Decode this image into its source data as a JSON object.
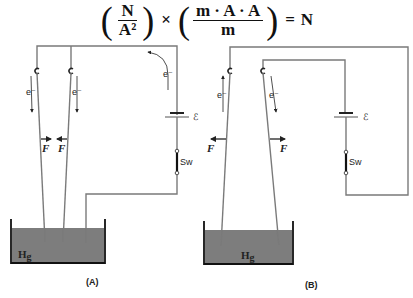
{
  "equation": {
    "frac1_num": "N",
    "frac1_den": "A²",
    "times": "×",
    "frac2_num": "m · A · A",
    "frac2_den": "m",
    "equals": "=",
    "result": "N"
  },
  "diagram_a": {
    "caption": "(A)",
    "electron_label": "e⁻",
    "force_label": "F",
    "battery_label": "ℰ",
    "switch_label": "Sw",
    "liquid_label": "Hg",
    "force_direction": "attract"
  },
  "diagram_b": {
    "caption": "(B)",
    "electron_label": "e⁻",
    "force_label": "F",
    "battery_label": "ℰ",
    "switch_label": "Sw",
    "liquid_label": "Hg",
    "force_direction": "repel"
  },
  "colors": {
    "wire": "#7a7a7a",
    "mercury": "#7d7d7d",
    "ink": "#222222"
  }
}
